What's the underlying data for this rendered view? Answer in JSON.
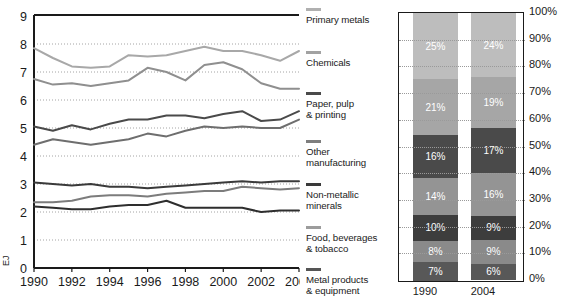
{
  "chart_data": [
    {
      "type": "line",
      "title": "",
      "xlabel": "",
      "ylabel": "EJ",
      "ylim": [
        0,
        9
      ],
      "xlim": [
        1990,
        2004
      ],
      "grid": true,
      "yticks": [
        "0",
        "1",
        "2",
        "3",
        "4",
        "5",
        "6",
        "7",
        "8",
        "9"
      ],
      "xticks": [
        "1990",
        "1992",
        "1994",
        "1996",
        "1998",
        "2000",
        "2002",
        "2004"
      ],
      "x": [
        1990,
        1991,
        1992,
        1993,
        1994,
        1995,
        1996,
        1997,
        1998,
        1999,
        2000,
        2001,
        2002,
        2003,
        2004
      ],
      "series": [
        {
          "name": "Chemicals",
          "color": "#a8a8a8",
          "values": [
            7.85,
            7.5,
            7.2,
            7.15,
            7.2,
            7.6,
            7.55,
            7.6,
            7.75,
            7.9,
            7.75,
            7.75,
            7.6,
            7.4,
            7.75
          ]
        },
        {
          "name": "Primary metals",
          "color": "#8f8f8f",
          "values": [
            6.75,
            6.55,
            6.6,
            6.5,
            6.6,
            6.7,
            7.15,
            7.0,
            6.7,
            7.25,
            7.35,
            7.1,
            6.6,
            6.4,
            6.4
          ]
        },
        {
          "name": "Other manufacturing",
          "color": "#4a4a4a",
          "values": [
            5.05,
            4.9,
            5.1,
            4.95,
            5.15,
            5.3,
            5.3,
            5.45,
            5.45,
            5.35,
            5.5,
            5.6,
            5.25,
            5.3,
            5.6
          ]
        },
        {
          "name": "Paper, pulp & printing",
          "color": "#6e6e6e",
          "values": [
            4.4,
            4.6,
            4.5,
            4.4,
            4.5,
            4.6,
            4.8,
            4.7,
            4.9,
            5.05,
            5.0,
            5.05,
            5.0,
            5.0,
            5.3
          ]
        },
        {
          "name": "Food, beverages & tobacco",
          "color": "#3a3a3a",
          "values": [
            3.05,
            3.0,
            2.95,
            3.0,
            2.9,
            2.9,
            2.85,
            2.9,
            2.95,
            3.0,
            3.05,
            3.1,
            3.05,
            3.1,
            3.1
          ]
        },
        {
          "name": "Non-metallic minerals",
          "color": "#7c7c7c",
          "values": [
            2.35,
            2.35,
            2.4,
            2.55,
            2.6,
            2.6,
            2.55,
            2.65,
            2.7,
            2.75,
            2.75,
            2.9,
            2.85,
            2.8,
            2.85
          ]
        },
        {
          "name": "Metal products & equipment",
          "color": "#2e2e2e",
          "values": [
            2.2,
            2.15,
            2.1,
            2.1,
            2.2,
            2.25,
            2.25,
            2.4,
            2.15,
            2.15,
            2.15,
            2.15,
            2.0,
            2.05,
            2.05
          ]
        }
      ]
    },
    {
      "type": "bar",
      "stacked": true,
      "normalized": true,
      "title": "",
      "xlabel": "",
      "ylabel": "",
      "ylim": [
        0,
        100
      ],
      "grid": true,
      "categories": [
        "1990",
        "2004"
      ],
      "yticks": [
        "100%",
        "90%",
        "80%",
        "70%",
        "60%",
        "50%",
        "40%",
        "30%",
        "20%",
        "10%",
        "0%"
      ],
      "series": [
        {
          "name": "Primary metals",
          "color": "#bdbdbd",
          "values": [
            25,
            24
          ],
          "labels": [
            "25%",
            "24%"
          ]
        },
        {
          "name": "Chemicals",
          "color": "#a6a6a6",
          "values": [
            21,
            19
          ],
          "labels": [
            "21%",
            "19%"
          ]
        },
        {
          "name": "Paper, pulp & printing",
          "color": "#4a4a4a",
          "values": [
            16,
            17
          ],
          "labels": [
            "16%",
            "17%"
          ]
        },
        {
          "name": "Other manufacturing",
          "color": "#949494",
          "values": [
            14,
            16
          ],
          "labels": [
            "14%",
            "16%"
          ]
        },
        {
          "name": "Non-metallic minerals",
          "color": "#3d3d3d",
          "values": [
            10,
            9
          ],
          "labels": [
            "10%",
            "9%"
          ]
        },
        {
          "name": "Food, beverages & tobacco",
          "color": "#8a8a8a",
          "values": [
            8,
            9
          ],
          "labels": [
            "8%",
            "9%"
          ]
        },
        {
          "name": "Metal products & equipment",
          "color": "#585858",
          "values": [
            7,
            6
          ],
          "labels": [
            "7%",
            "6%"
          ]
        }
      ]
    }
  ],
  "line_chart": {
    "unit_label": "EJ",
    "yticks": [
      "9",
      "8",
      "7",
      "6",
      "5",
      "4",
      "3",
      "2",
      "1",
      "0"
    ],
    "xticks": [
      "1990",
      "1992",
      "1994",
      "1996",
      "1998",
      "2000",
      "2002",
      "2004"
    ]
  },
  "legend": {
    "items": [
      {
        "label": "Primary metals",
        "color": "#b0b0b0"
      },
      {
        "label": "Chemicals",
        "color": "#a2a2a2"
      },
      {
        "label": "Paper, pulp\n& printing",
        "color": "#4a4a4a"
      },
      {
        "label": "Other\nmanufacturing",
        "color": "#7e7e7e"
      },
      {
        "label": "Non-metallic\nminerals",
        "color": "#3a3a3a"
      },
      {
        "label": "Food, beverages\n& tobacco",
        "color": "#9c9c9c"
      },
      {
        "label": "Metal products\n& equipment",
        "color": "#555555"
      }
    ]
  },
  "bar_chart": {
    "categories": [
      "1990",
      "2004"
    ],
    "yticks": [
      "100%",
      "90%",
      "80%",
      "70%",
      "60%",
      "50%",
      "40%",
      "30%",
      "20%",
      "10%",
      "0%"
    ]
  }
}
